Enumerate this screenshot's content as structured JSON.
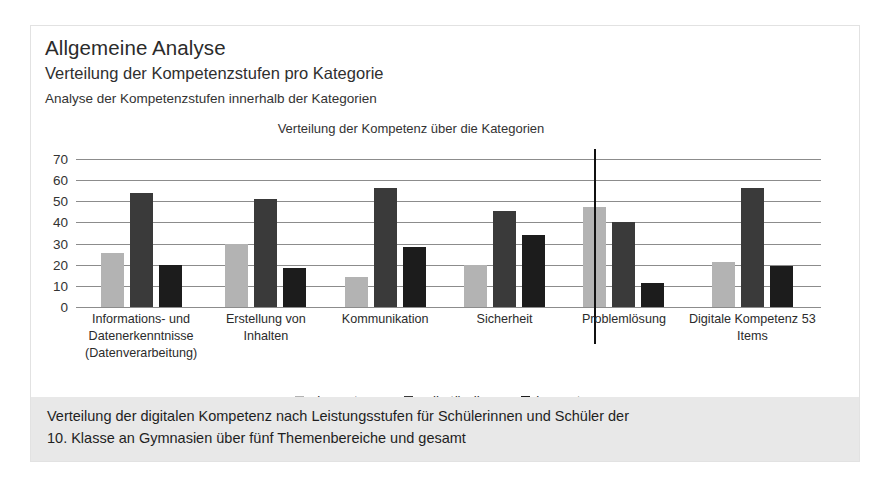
{
  "header": {
    "title": "Allgemeine Analyse",
    "subtitle": "Verteilung der Kompetenzstufen pro Kategorie",
    "description": "Analyse der Kompetenzstufen innerhalb der Kategorien"
  },
  "caption": {
    "line1": "Verteilung der digitalen Kompetenz nach Leistungsstufen für Schülerinnen und Schüler der",
    "line2": "10. Klasse an Gymnasien über fünf Themenbereiche und gesamt"
  },
  "colors": {
    "elementar": "#b3b3b3",
    "selbstaendig": "#3a3a3a",
    "kompetenz": "#1c1c1c",
    "gridline": "#8c8c8c",
    "divider": "#111111",
    "caption_band": "#e8e8e8",
    "card_background": "#ffffff"
  },
  "chart_data": {
    "type": "bar",
    "title": "Verteilung der Kompetenz über die Kategorien",
    "xlabel": "",
    "ylabel": "",
    "ylim": [
      0,
      70
    ],
    "yticks": [
      0,
      10,
      20,
      30,
      40,
      50,
      60,
      70
    ],
    "ytick_labels": [
      "0",
      "10",
      "20",
      "30",
      "40",
      "50",
      "60",
      "70"
    ],
    "grid": true,
    "legend_position": "bottom",
    "categories": [
      "Informations- und Datenerkenntnisse (Datenverarbeitung)",
      "Erstellung von Inhalten",
      "Kommunikation",
      "Sicherheit",
      "Problemlösung",
      "Digitale Kompetenz 53 Items"
    ],
    "category_lines": [
      [
        "Informations- und",
        "Datenerkenntnisse",
        "(Datenverarbeitung)"
      ],
      [
        "Erstellung von Inhalten"
      ],
      [
        "Kommunikation"
      ],
      [
        "Sicherheit"
      ],
      [
        "Problemlösung"
      ],
      [
        "Digitale Kompetenz 53",
        "Items"
      ]
    ],
    "series": [
      {
        "name": "elementar",
        "values": [
          25.5,
          30,
          14,
          20,
          47.5,
          21.5
        ]
      },
      {
        "name": "selbständig",
        "values": [
          54,
          51,
          56.5,
          45.5,
          40,
          56.5
        ]
      },
      {
        "name": "kompetenz",
        "values": [
          20,
          18.5,
          28.5,
          34,
          11.5,
          19.5
        ]
      }
    ],
    "annotations": [
      {
        "type": "vertical-divider",
        "after_category": "Problemlösung"
      }
    ]
  }
}
